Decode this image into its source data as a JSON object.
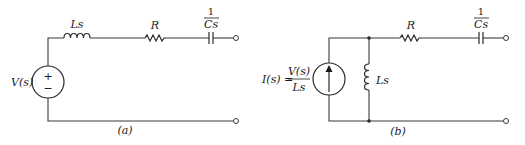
{
  "figure": {
    "circuit_a": {
      "caption": "(a)",
      "source": {
        "type": "voltage-source",
        "label": "V(s)",
        "polarity_plus": "+",
        "polarity_minus": "−"
      },
      "inductor": {
        "label": "Ls"
      },
      "resistor": {
        "label": "R"
      },
      "capacitor": {
        "label_num": "1",
        "label_den": "Cs"
      }
    },
    "circuit_b": {
      "caption": "(b)",
      "source": {
        "type": "current-source",
        "label_lhs": "I(s) =",
        "label_num": "V(s)",
        "label_den": "Ls"
      },
      "inductor": {
        "label": "Ls"
      },
      "resistor": {
        "label": "R"
      },
      "capacitor": {
        "label_num": "1",
        "label_den": "Cs"
      }
    }
  }
}
